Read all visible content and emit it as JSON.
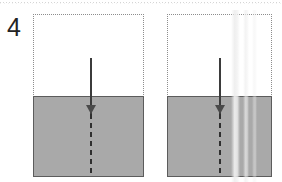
{
  "figure": {
    "label": "4",
    "canvas": {
      "width": 282,
      "height": 182,
      "background": "#ffffff"
    }
  },
  "colors": {
    "liquid_fill": "#a9a9a9",
    "liquid_border": "#5c5c5c",
    "container_outline": "#8d8d8d",
    "arrow": "#3b3b3b",
    "arrow_head": "#4a4a4a",
    "dashed_trail": "#2f2f2f",
    "label_text": "#232323",
    "scan_artifact": "#c8c8c8"
  },
  "panels": [
    {
      "name": "left-panel",
      "container": {
        "label": "container-outline",
        "style": "dotted",
        "x": 33,
        "y": 14,
        "width": 111,
        "height": 163
      },
      "liquid": {
        "label": "liquid-fill",
        "surface_y": 96,
        "height": 81,
        "fill": "#a9a9a9"
      },
      "arrow": {
        "label": "downward-arrow",
        "center_x": 91,
        "shaft_top_y": 58,
        "head_y": 119,
        "head_tip_y": 128,
        "trail_bottom_y": 176,
        "direction": "down"
      }
    },
    {
      "name": "right-panel",
      "container": {
        "label": "container-outline",
        "style": "dotted",
        "x": 167,
        "y": 14,
        "width": 105,
        "height": 163
      },
      "liquid": {
        "label": "liquid-fill",
        "surface_y": 96,
        "height": 81,
        "fill": "#a9a9a9"
      },
      "arrow": {
        "label": "downward-arrow",
        "center_x": 220,
        "shaft_top_y": 58,
        "head_y": 119,
        "head_tip_y": 128,
        "trail_bottom_y": 176,
        "direction": "down"
      }
    }
  ],
  "artifacts": {
    "top_rule": {
      "label": "scan-dotted-rule",
      "y": 2
    },
    "vertical_streak": {
      "label": "scan-vertical-streak",
      "x": 231
    }
  }
}
